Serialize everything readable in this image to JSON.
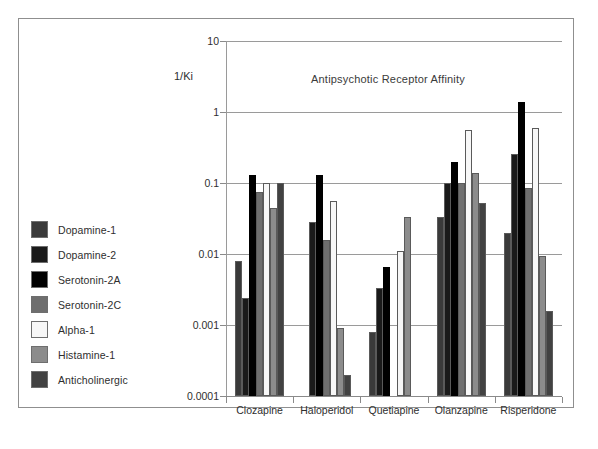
{
  "chart_data": {
    "type": "bar",
    "title": "Antipsychotic Receptor Affinity",
    "xlabel": "",
    "ylabel": "1/Ki",
    "yscale": "log",
    "ylim": [
      0.0001,
      10
    ],
    "ytick_labels": [
      "10",
      "1",
      "0.1",
      "0.01",
      "0.001",
      "0.0001"
    ],
    "ytick_values": [
      10,
      1,
      0.1,
      0.01,
      0.001,
      0.0001
    ],
    "grid": true,
    "legend_position": "left-outside",
    "categories": [
      "Clozapine",
      "Haloperidol",
      "Quetiapine",
      "Olanzapine",
      "Risperidone"
    ],
    "series": [
      {
        "name": "Dopamine-1",
        "color": "#3a3a3a",
        "values": [
          0.008,
          null,
          0.0008,
          0.033,
          0.02
        ]
      },
      {
        "name": "Dopamine-2",
        "color": "#1a1a1a",
        "values": [
          0.0024,
          0.028,
          0.0033,
          0.1,
          0.26
        ]
      },
      {
        "name": "Serotonin-2A",
        "color": "#000000",
        "values": [
          0.13,
          0.13,
          0.0065,
          0.2,
          1.4
        ]
      },
      {
        "name": "Serotonin-2C",
        "color": "#6e6e6e",
        "values": [
          0.075,
          0.016,
          null,
          0.1,
          0.085
        ]
      },
      {
        "name": "Alpha-1",
        "color": "#f7f7f7",
        "values": [
          0.1,
          0.055,
          0.011,
          0.55,
          0.6
        ]
      },
      {
        "name": "Histamine-1",
        "color": "#8c8c8c",
        "values": [
          0.045,
          0.0009,
          0.033,
          0.14,
          0.0095
        ]
      },
      {
        "name": "Anticholinergic",
        "color": "#424242",
        "values": [
          0.1,
          0.0002,
          null,
          0.053,
          0.0016
        ]
      }
    ]
  },
  "legend": {
    "items": [
      {
        "label": "Dopamine-1",
        "color": "#3a3a3a"
      },
      {
        "label": "Dopamine-2",
        "color": "#1a1a1a"
      },
      {
        "label": "Serotonin-2A",
        "color": "#000000"
      },
      {
        "label": "Serotonin-2C",
        "color": "#6e6e6e"
      },
      {
        "label": "Alpha-1",
        "color": "#f7f7f7"
      },
      {
        "label": "Histamine-1",
        "color": "#8c8c8c"
      },
      {
        "label": "Anticholinergic",
        "color": "#424242"
      }
    ]
  },
  "caption": ""
}
